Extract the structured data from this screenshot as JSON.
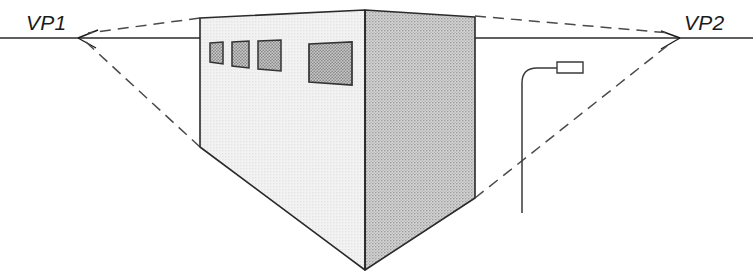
{
  "diagram": {
    "background_color": "#ffffff",
    "line_color": "#222222",
    "dash_color": "#555555",
    "labels": {
      "vp1": "VP1",
      "vp2": "VP2"
    },
    "horizon": {
      "name": "horizon-line",
      "y": 38,
      "x_start": 0,
      "x_end": 753,
      "style": "solid"
    },
    "vanishing_points": [
      {
        "id": "vp1",
        "label": "VP1",
        "x": 78,
        "y": 38,
        "arrow": "left"
      },
      {
        "id": "vp2",
        "label": "VP2",
        "x": 680,
        "y": 38,
        "arrow": "right"
      }
    ],
    "building": {
      "name": "building-block",
      "left_face_color": "#ededed",
      "right_face_color": "#c9c9c9",
      "outline_color": "#2a2a2a",
      "corners": {
        "left_top": {
          "x": 200,
          "y": 18
        },
        "left_bottom": {
          "x": 200,
          "y": 147
        },
        "front_top": {
          "x": 365,
          "y": 10
        },
        "front_bottom": {
          "x": 365,
          "y": 270
        },
        "right_top": {
          "x": 475,
          "y": 17
        },
        "right_bottom": {
          "x": 475,
          "y": 198
        }
      }
    },
    "windows": [
      {
        "id": "window-1",
        "x": 210,
        "y": 42,
        "w": 13,
        "h": 22,
        "fill": "#b8b8b8"
      },
      {
        "id": "window-2",
        "x": 232,
        "y": 42,
        "w": 16,
        "h": 26,
        "fill": "#b8b8b8"
      },
      {
        "id": "window-3",
        "x": 258,
        "y": 42,
        "w": 22,
        "h": 29,
        "fill": "#b8b8b8"
      },
      {
        "id": "window-4",
        "x": 309,
        "y": 44,
        "w": 42,
        "h": 40,
        "fill": "#b8b8b8"
      }
    ],
    "lamp_post": {
      "name": "street-lamp",
      "pole_x": 522,
      "pole_top_y": 75,
      "pole_bottom_y": 213,
      "arm_end_x": 557,
      "arm_y": 68,
      "head": {
        "x": 557,
        "y": 62,
        "w": 26,
        "h": 11
      }
    },
    "perspective_lines": [
      {
        "id": "vp1-top-line",
        "from": {
          "x": 200,
          "y": 18
        },
        "to": {
          "x": 86,
          "y": 34
        },
        "style": "dashed"
      },
      {
        "id": "vp1-bottom-line",
        "from": {
          "x": 200,
          "y": 147
        },
        "to": {
          "x": 86,
          "y": 42
        },
        "style": "dashed"
      },
      {
        "id": "vp2-top-line",
        "from": {
          "x": 475,
          "y": 17
        },
        "to": {
          "x": 672,
          "y": 34
        },
        "style": "dashed"
      },
      {
        "id": "vp2-bottom-line",
        "from": {
          "x": 475,
          "y": 198
        },
        "to": {
          "x": 672,
          "y": 42
        },
        "style": "dashed"
      }
    ]
  }
}
